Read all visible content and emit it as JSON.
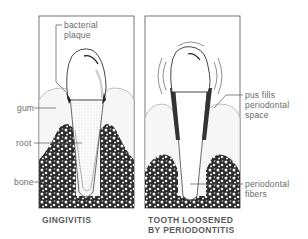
{
  "diagram": {
    "panels": [
      {
        "id": "gingivitis",
        "caption": "GINGIVITIS",
        "labels": {
          "plaque": [
            "bacterial",
            "plaque"
          ],
          "gum": "gum",
          "root": "root",
          "bone": "bone"
        }
      },
      {
        "id": "periodontitis",
        "caption_lines": [
          "TOOTH LOOSENED",
          "BY PERIODONTITIS"
        ],
        "labels": {
          "pus": [
            "pus fills",
            "periodontal",
            "space"
          ],
          "fibers": [
            "periodontal",
            "fibers"
          ]
        }
      }
    ],
    "colors": {
      "frame": "#555555",
      "text": "#6a6a6a",
      "bone": "#2a2a2a",
      "gum": "#f2f2f2"
    }
  }
}
